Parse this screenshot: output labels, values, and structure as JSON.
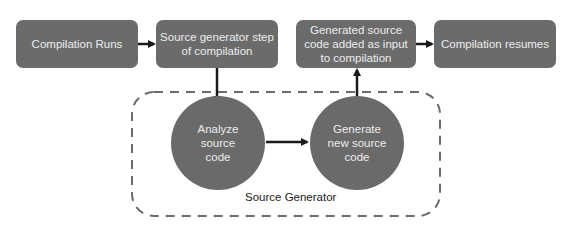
{
  "diagram": {
    "steps": [
      {
        "id": "compilation-runs",
        "label": "Compilation Runs"
      },
      {
        "id": "source-generator-step",
        "label": "Source generator step\nof compilation"
      },
      {
        "id": "generated-source-added",
        "label": "Generated source\ncode added as input\nto compilation"
      },
      {
        "id": "compilation-resumes",
        "label": "Compilation resumes"
      }
    ],
    "generator": {
      "title": "Source Generator",
      "nodes": [
        {
          "id": "analyze-source-code",
          "label": "Analyze\nsource\ncode"
        },
        {
          "id": "generate-new-source-code",
          "label": "Generate\nnew source\ncode"
        }
      ]
    },
    "colors": {
      "node_fill": "#6b6b6b",
      "node_text": "#ececec",
      "arrow": "#1a1a1a",
      "dashed_border": "#6b6b6b"
    }
  }
}
